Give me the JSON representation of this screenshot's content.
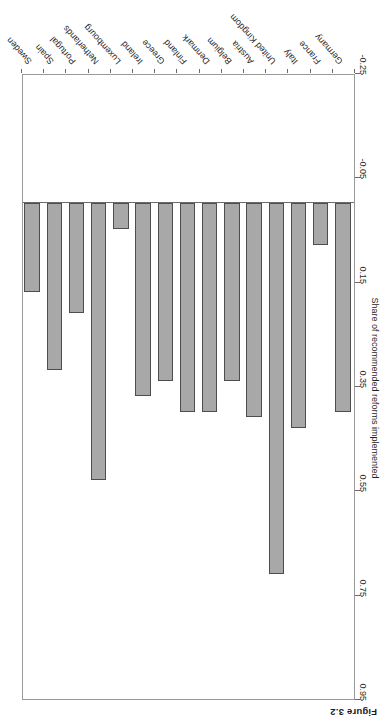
{
  "figure": {
    "caption": "Figure 3.2",
    "rotation_degrees": 180
  },
  "chart_data": {
    "type": "bar",
    "orientation": "vertical",
    "title": "",
    "xlabel": "",
    "ylabel": "Share of recommended reforms implemented",
    "ylim": [
      -0.25,
      0.95
    ],
    "yticks": [
      -0.25,
      -0.05,
      0.15,
      0.35,
      0.55,
      0.75,
      0.95
    ],
    "ytick_labels": [
      "-0.25",
      "-0.05",
      "0.15",
      "0.35",
      "0.55",
      "0.75",
      "0.95"
    ],
    "grid": false,
    "legend": null,
    "bar_color": "#a8a8a8",
    "bar_edge_color": "#4d4d4d",
    "categories": [
      "Germany",
      "France",
      "Italy",
      "United Kingdom",
      "Austria",
      "Belgium",
      "Denmark",
      "Finland",
      "Greece",
      "Ireland",
      "Luxembourg",
      "Netherlands",
      "Portugal",
      "Spain",
      "Sweden"
    ],
    "values": [
      0.4,
      0.08,
      0.43,
      0.71,
      0.41,
      0.34,
      0.4,
      0.4,
      0.34,
      0.37,
      0.05,
      0.53,
      0.21,
      0.32,
      0.17
    ]
  }
}
